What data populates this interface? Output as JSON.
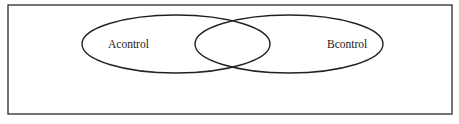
{
  "diagram": {
    "type": "venn",
    "frame": {
      "x": 8,
      "y": 5,
      "width": 444,
      "height": 109,
      "stroke": "#3a3a3a"
    },
    "sets": [
      {
        "label": "Acontrol",
        "cx": 176,
        "cy": 44,
        "rx": 94,
        "ry": 29,
        "label_x": 130,
        "label_y": 48
      },
      {
        "label": "Bcontrol",
        "cx": 289,
        "cy": 44,
        "rx": 94,
        "ry": 29,
        "label_x": 327,
        "label_y": 48
      }
    ]
  }
}
